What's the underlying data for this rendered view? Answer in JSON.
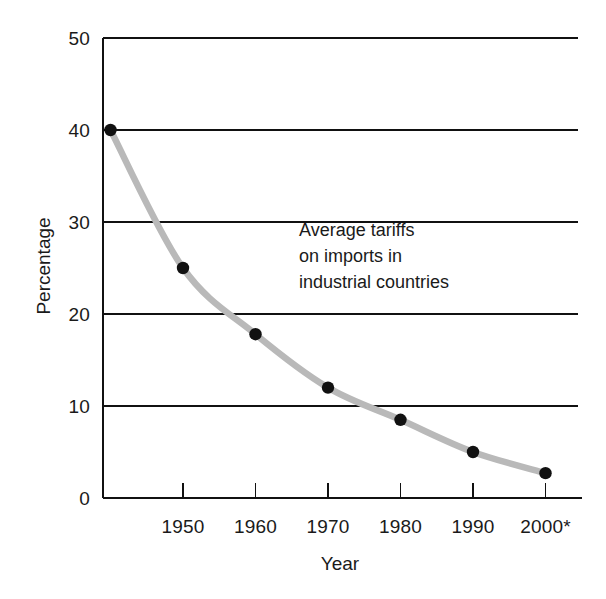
{
  "chart_data": {
    "type": "line",
    "title": "",
    "xlabel": "Year",
    "ylabel": "Percentage",
    "xlim": [
      1940,
      2002
    ],
    "ylim": [
      0,
      50
    ],
    "grid": "horizontal",
    "legend": "none",
    "x_tick_labels": [
      "1950",
      "1960",
      "1970",
      "1980",
      "1990",
      "2000*"
    ],
    "x_ticks": [
      1950,
      1960,
      1970,
      1980,
      1990,
      2000
    ],
    "y_tick_labels": [
      "0",
      "10",
      "20",
      "30",
      "40",
      "50"
    ],
    "y_ticks": [
      0,
      10,
      20,
      30,
      40,
      50
    ],
    "series": [
      {
        "name": "Average tariffs on imports in industrial countries",
        "marker": "filled-circle",
        "line_color": "#b9b9b9",
        "marker_color": "#111111",
        "x": [
          1940,
          1950,
          1960,
          1970,
          1980,
          1990,
          2000
        ],
        "values": [
          40,
          25,
          17.8,
          12,
          8.5,
          5,
          2.7
        ]
      }
    ],
    "annotations": [
      {
        "name": "series-annotation",
        "lines": [
          "Average tariffs",
          "on imports in",
          "industrial countries"
        ],
        "x": 1966,
        "y": 28.5
      }
    ]
  },
  "colors": {
    "line": "#b9b9b9",
    "marker": "#111111",
    "axis": "#111111",
    "grid": "#111111",
    "text": "#1a1a1a",
    "background": "#ffffff"
  }
}
